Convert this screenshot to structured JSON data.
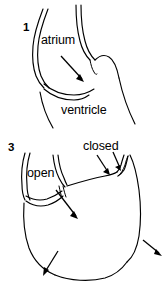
{
  "figure": {
    "background_color": "#ffffff",
    "line_color": "#000000",
    "panels": [
      {
        "number": "1",
        "name": "panel-1-filling",
        "labels": [
          "atrium",
          "ventricle"
        ],
        "arrows": 1
      },
      {
        "number": "3",
        "name": "panel-3-contraction",
        "labels": [
          "open",
          "closed"
        ],
        "arrows": 4
      }
    ],
    "labels": {
      "atrium": "atrium",
      "ventricle": "ventricle",
      "open": "open",
      "closed": "closed"
    },
    "numbers": {
      "first": "1",
      "third": "3"
    },
    "icons": {
      "flow_arrow": "arrow-icon",
      "valve_arrow": "arrow-icon"
    }
  }
}
